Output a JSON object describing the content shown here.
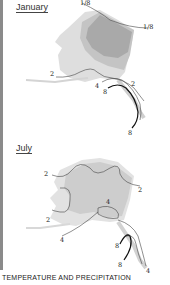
{
  "maps": [
    {
      "title": "January",
      "contour_labels": [
        "1/8",
        "1/8",
        "2",
        "2",
        "4",
        "8",
        "8"
      ],
      "shade_colors": {
        "dark": "#a9a9a9",
        "medium": "#c4c4c4",
        "light": "#dedede"
      }
    },
    {
      "title": "July",
      "contour_labels": [
        "2",
        "2",
        "2",
        "4",
        "4",
        "8",
        "8",
        "4"
      ],
      "shade_colors": {
        "medium": "#cdcdcd",
        "light": "#e2e2e2"
      }
    }
  ],
  "caption": "TEMPERATURE AND PRECIPITATION"
}
